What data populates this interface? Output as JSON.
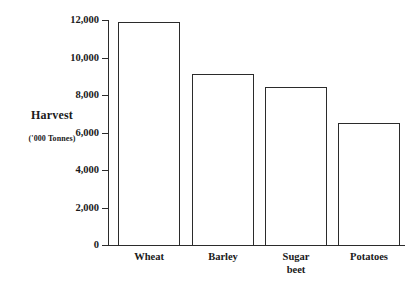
{
  "chart_data": {
    "type": "bar",
    "title": "",
    "subtitle": "",
    "xlabel": "",
    "ylabel": "Harvest",
    "ylabel_units": "('000 Tonnes)",
    "categories": [
      "Wheat",
      "Barley",
      "Sugar beet",
      "Potatoes"
    ],
    "category_labels_raw": [
      "Wheat",
      "Barley",
      "Sugar\nbeet",
      "Potatoes"
    ],
    "values": [
      11900,
      9100,
      8450,
      6500
    ],
    "ylim": [
      0,
      12000
    ],
    "ytick_values": [
      0,
      2000,
      4000,
      6000,
      8000,
      10000,
      12000
    ],
    "ytick_labels": [
      "0",
      "2,000",
      "4,000",
      "6,000",
      "8,000",
      "10,000",
      "12,000"
    ],
    "grid": false,
    "legend": false,
    "bar_fill_color": "#ffffff",
    "bar_edge_color": "#2b2b2b",
    "axis_color": "#2b2b2b",
    "background_color": "#ffffff"
  }
}
